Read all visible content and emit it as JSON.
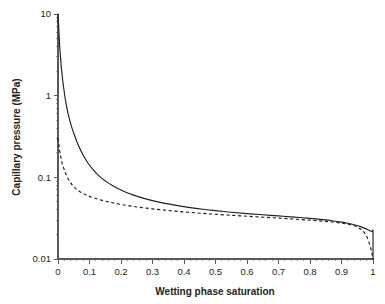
{
  "chart_data": {
    "type": "line",
    "title": "",
    "xlabel": "Wetting phase saturation",
    "ylabel": "Capillary pressure (MPa)",
    "xlim": [
      0,
      1
    ],
    "ylim": [
      0.01,
      10
    ],
    "yscale": "log",
    "xscale": "linear",
    "grid": false,
    "legend": "none",
    "xticks": [
      "0",
      "0.1",
      "0.2",
      "0.3",
      "0.4",
      "0.5",
      "0.6",
      "0.7",
      "0.8",
      "0.9",
      "1"
    ],
    "xtick_values": [
      0,
      0.1,
      0.2,
      0.3,
      0.4,
      0.5,
      0.6,
      0.7,
      0.8,
      0.9,
      1
    ],
    "yticks": [
      "10",
      "1",
      "0.1",
      "0.01"
    ],
    "ytick_values": [
      10,
      1,
      0.1,
      0.01
    ],
    "series": [
      {
        "name": "solid-curve",
        "style": "solid",
        "color": "#231f20",
        "x": [
          0.0,
          0.002,
          0.005,
          0.008,
          0.012,
          0.018,
          0.025,
          0.033,
          0.042,
          0.052,
          0.065,
          0.08,
          0.095,
          0.11,
          0.13,
          0.15,
          0.17,
          0.19,
          0.21,
          0.24,
          0.27,
          0.3,
          0.34,
          0.38,
          0.42,
          0.46,
          0.5,
          0.55,
          0.6,
          0.65,
          0.7,
          0.75,
          0.8,
          0.84,
          0.87,
          0.9,
          0.92,
          0.94,
          0.96,
          0.975,
          0.99,
          0.998,
          1.0,
          1.0
        ],
        "y": [
          10.0,
          7.2,
          4.3,
          2.9,
          1.95,
          1.25,
          0.82,
          0.58,
          0.43,
          0.33,
          0.245,
          0.186,
          0.15,
          0.126,
          0.104,
          0.0905,
          0.0805,
          0.073,
          0.0672,
          0.0605,
          0.0556,
          0.0519,
          0.048,
          0.045,
          0.0426,
          0.0407,
          0.0391,
          0.0374,
          0.036,
          0.0348,
          0.0337,
          0.0326,
          0.0314,
          0.0303,
          0.0294,
          0.0283,
          0.0274,
          0.0263,
          0.0249,
          0.0237,
          0.0222,
          0.0216,
          0.0215,
          0.01
        ]
      },
      {
        "name": "dashed-curve",
        "style": "dashed",
        "color": "#231f20",
        "x": [
          0.0,
          0.002,
          0.005,
          0.009,
          0.014,
          0.02,
          0.028,
          0.037,
          0.047,
          0.058,
          0.07,
          0.085,
          0.1,
          0.12,
          0.14,
          0.16,
          0.18,
          0.21,
          0.24,
          0.27,
          0.3,
          0.34,
          0.38,
          0.42,
          0.46,
          0.5,
          0.55,
          0.6,
          0.65,
          0.7,
          0.75,
          0.8,
          0.84,
          0.87,
          0.9,
          0.92,
          0.935,
          0.95,
          0.962,
          0.972,
          0.982,
          0.99,
          0.996,
          1.0
        ],
        "y": [
          0.3,
          0.262,
          0.215,
          0.176,
          0.145,
          0.124,
          0.1035,
          0.0895,
          0.079,
          0.0718,
          0.0668,
          0.062,
          0.0585,
          0.055,
          0.0522,
          0.05,
          0.0482,
          0.0458,
          0.044,
          0.0424,
          0.0411,
          0.0396,
          0.0383,
          0.0372,
          0.0362,
          0.0353,
          0.0343,
          0.0334,
          0.0325,
          0.0317,
          0.0308,
          0.0299,
          0.0291,
          0.0284,
          0.0275,
          0.0267,
          0.0259,
          0.0246,
          0.0231,
          0.0212,
          0.0182,
          0.0147,
          0.0121,
          0.01
        ]
      }
    ]
  },
  "geometry": {
    "plot_left": 58,
    "plot_right": 373,
    "plot_top": 14,
    "plot_bottom": 259
  },
  "colors": {
    "axis": "#58595b",
    "curve": "#231f20",
    "background": "#ffffff"
  }
}
